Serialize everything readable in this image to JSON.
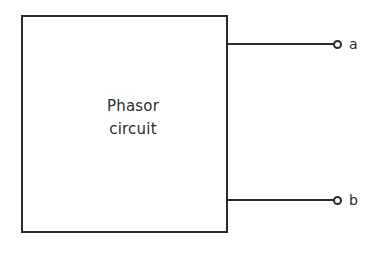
{
  "figure": {
    "type": "circuit-diagram",
    "background_color": "#ffffff",
    "ink_color": "#2b2b2b",
    "block": {
      "label_line_1": "Phasor",
      "label_line_2": "circuit",
      "shape": "rectangle",
      "fill": "#ffffff",
      "stroke": "#2b2b2b"
    },
    "terminals": [
      {
        "id": "a",
        "label": "a",
        "marker": "open-circle-terminal-icon",
        "position": "top-right"
      },
      {
        "id": "b",
        "label": "b",
        "marker": "open-circle-terminal-icon",
        "position": "bottom-right"
      }
    ],
    "leads": [
      {
        "id": "lead-a",
        "from": "block-right-edge",
        "to": "terminal-a"
      },
      {
        "id": "lead-b",
        "from": "block-right-edge",
        "to": "terminal-b"
      }
    ]
  }
}
